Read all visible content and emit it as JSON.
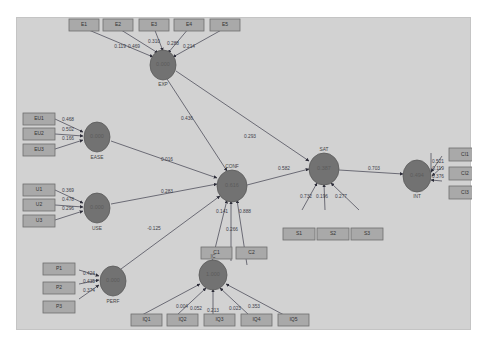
{
  "diagram": {
    "type": "pls-sem-path-model",
    "latent_variables": [
      {
        "id": "EXP",
        "label": "EXP",
        "value": "0.000"
      },
      {
        "id": "EASE",
        "label": "EASE",
        "value": "0.000"
      },
      {
        "id": "USE",
        "label": "USE",
        "value": "0.000"
      },
      {
        "id": "PERF",
        "label": "PERF",
        "value": "0.000"
      },
      {
        "id": "CONF",
        "label": "CONF",
        "value": "0.616"
      },
      {
        "id": "IC",
        "label": "IC",
        "value": "1.000"
      },
      {
        "id": "SAT",
        "label": "SAT",
        "value": "0.387"
      },
      {
        "id": "INT",
        "label": "INT",
        "value": "0.494"
      }
    ],
    "indicators": {
      "EXP": [
        {
          "label": "E1",
          "w": "0.119"
        },
        {
          "label": "E2",
          "w": "0.469"
        },
        {
          "label": "E3",
          "w": "0.310"
        },
        {
          "label": "E4",
          "w": "0.288"
        },
        {
          "label": "E5",
          "w": "0.214"
        }
      ],
      "EASE": [
        {
          "label": "EU1",
          "w": "0.468"
        },
        {
          "label": "EU2",
          "w": "0.502"
        },
        {
          "label": "EU3",
          "w": "0.166"
        }
      ],
      "USE": [
        {
          "label": "U1",
          "w": "0.369"
        },
        {
          "label": "U2",
          "w": "0.478"
        },
        {
          "label": "U3",
          "w": "0.296"
        }
      ],
      "PERF": [
        {
          "label": "P1",
          "w": "0.424"
        },
        {
          "label": "P2",
          "w": "0.435"
        },
        {
          "label": "P3",
          "w": "0.374"
        }
      ],
      "CONF": [
        {
          "label": "C1",
          "w": "0.141"
        },
        {
          "label": "C2",
          "w": "0.888"
        }
      ],
      "IC": [
        {
          "label": "IQ1",
          "w": "0.004"
        },
        {
          "label": "IQ2",
          "w": "0.052"
        },
        {
          "label": "IQ3",
          "w": "0.213"
        },
        {
          "label": "IQ4",
          "w": "0.023"
        },
        {
          "label": "IQ5",
          "w": "0.353"
        }
      ],
      "SAT": [
        {
          "label": "S1",
          "w": "0.732"
        },
        {
          "label": "S2",
          "w": "0.196"
        },
        {
          "label": "S3",
          "w": "0.277"
        }
      ],
      "INT": [
        {
          "label": "CI1",
          "w": "0.521"
        },
        {
          "label": "CI2",
          "w": "0.119"
        },
        {
          "label": "CI3",
          "w": "0.376"
        }
      ]
    },
    "paths": [
      {
        "from": "EXP",
        "to": "CONF",
        "coef": "0.436"
      },
      {
        "from": "EXP",
        "to": "SAT",
        "coef": "0.293"
      },
      {
        "from": "EASE",
        "to": "CONF",
        "coef": "0.016"
      },
      {
        "from": "USE",
        "to": "CONF",
        "coef": "0.283"
      },
      {
        "from": "PERF",
        "to": "CONF",
        "coef": "-0.125"
      },
      {
        "from": "IC",
        "to": "CONF",
        "coef": "0.266"
      },
      {
        "from": "CONF",
        "to": "SAT",
        "coef": "0.582"
      },
      {
        "from": "SAT",
        "to": "INT",
        "coef": "0.703"
      }
    ],
    "colors": {
      "canvas": "#d2d2d2",
      "latent_fill": "#727272",
      "indicator_fill": "#a9a9a9",
      "edge": "#5f5f6a"
    }
  }
}
